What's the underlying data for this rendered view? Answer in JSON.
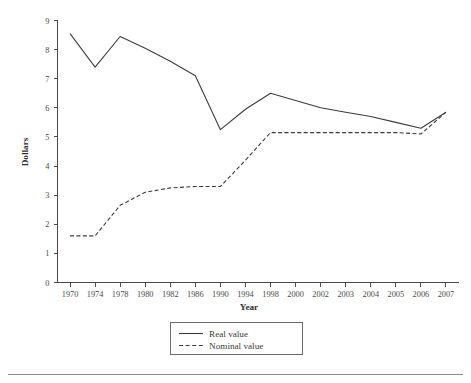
{
  "chart_data": {
    "type": "line",
    "title": "",
    "xlabel": "Year",
    "ylabel": "Dollars",
    "categories": [
      "1970",
      "1974",
      "1978",
      "1980",
      "1982",
      "1986",
      "1990",
      "1994",
      "1998",
      "2000",
      "2002",
      "2003",
      "2004",
      "2005",
      "2006",
      "2007"
    ],
    "ylim": [
      0,
      9
    ],
    "yticks": [
      0,
      1,
      2,
      3,
      4,
      5,
      6,
      7,
      8,
      9
    ],
    "ytick_labels": [
      "0",
      "1",
      "2",
      "3",
      "4",
      "5",
      "6",
      "7",
      "8",
      "9"
    ],
    "grid": false,
    "legend_position": "below-axes-center",
    "series": [
      {
        "name": "Real value",
        "style": "solid",
        "color": "#3c3c3c",
        "values": [
          8.55,
          7.4,
          8.45,
          8.05,
          7.6,
          7.1,
          5.25,
          5.95,
          6.5,
          6.25,
          6.0,
          5.85,
          5.7,
          5.5,
          5.3,
          5.85
        ]
      },
      {
        "name": "Nominal value",
        "style": "dashed",
        "color": "#3c3c3c",
        "values": [
          1.6,
          1.6,
          2.65,
          3.1,
          3.25,
          3.3,
          3.3,
          4.2,
          5.15,
          5.15,
          5.15,
          5.15,
          5.15,
          5.15,
          5.1,
          5.85
        ]
      }
    ]
  },
  "axes": {
    "ylabel": "Dollars",
    "xlabel": "Year"
  },
  "legend": {
    "items": [
      {
        "label": "Real value",
        "style": "solid"
      },
      {
        "label": "Nominal value",
        "style": "dashed"
      }
    ]
  }
}
